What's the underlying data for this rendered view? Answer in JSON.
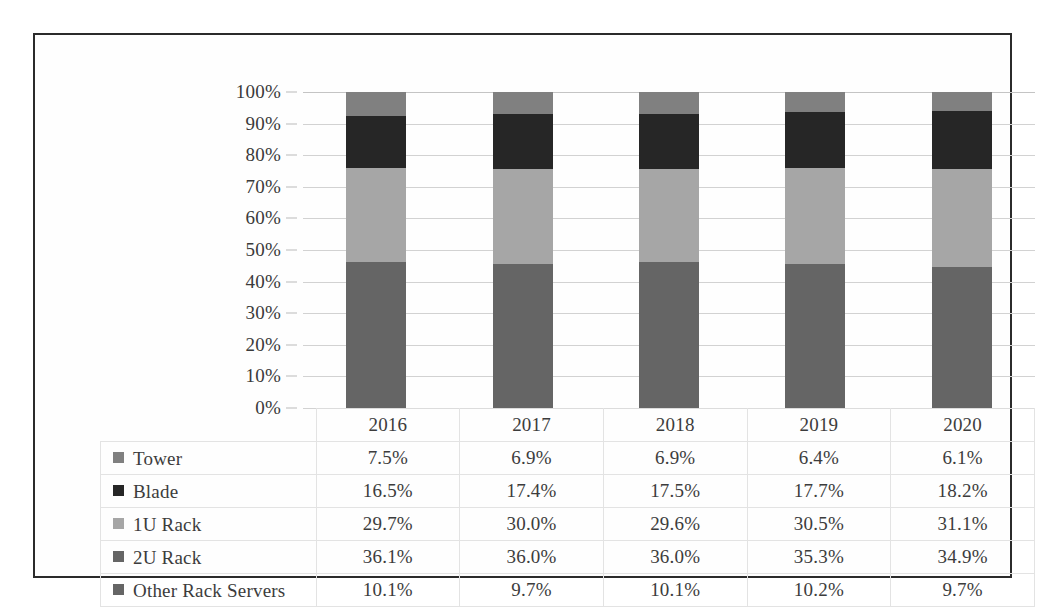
{
  "chart_data": {
    "type": "bar",
    "subtype": "100% stacked column with data table",
    "title": "",
    "xlabel": "",
    "ylabel": "",
    "ylim": [
      0,
      100
    ],
    "grid": true,
    "legend_position": "data-table-row-headers",
    "categories": [
      "2016",
      "2017",
      "2018",
      "2019",
      "2020"
    ],
    "y_ticks": [
      "0%",
      "10%",
      "20%",
      "30%",
      "40%",
      "50%",
      "60%",
      "70%",
      "80%",
      "90%",
      "100%"
    ],
    "y_tick_values": [
      0,
      10,
      20,
      30,
      40,
      50,
      60,
      70,
      80,
      90,
      100
    ],
    "stack_order_top_to_bottom": [
      "Tower",
      "Blade",
      "1U Rack",
      "2U Rack",
      "Other Rack Servers"
    ],
    "series": [
      {
        "name": "Tower",
        "color": "#808080",
        "values": [
          7.5,
          6.9,
          6.9,
          6.4,
          6.1
        ],
        "labels": [
          "7.5%",
          "6.9%",
          "6.9%",
          "6.4%",
          "6.1%"
        ]
      },
      {
        "name": "Blade",
        "color": "#262626",
        "values": [
          16.5,
          17.4,
          17.5,
          17.7,
          18.2
        ],
        "labels": [
          "16.5%",
          "17.4%",
          "17.5%",
          "17.7%",
          "18.2%"
        ]
      },
      {
        "name": "1U Rack",
        "color": "#a6a6a6",
        "values": [
          29.7,
          30.0,
          29.6,
          30.5,
          31.1
        ],
        "labels": [
          "29.7%",
          "30.0%",
          "29.6%",
          "30.5%",
          "31.1%"
        ]
      },
      {
        "name": "2U Rack",
        "color": "#656565",
        "values": [
          36.1,
          36.0,
          36.0,
          35.3,
          34.9
        ],
        "labels": [
          "36.1%",
          "36.0%",
          "36.0%",
          "35.3%",
          "34.9%"
        ]
      },
      {
        "name": "Other Rack Servers",
        "color": "#656565",
        "values": [
          10.1,
          9.7,
          10.1,
          10.2,
          9.7
        ],
        "labels": [
          "10.1%",
          "9.7%",
          "10.1%",
          "10.2%",
          "9.7%"
        ]
      }
    ]
  },
  "table": {
    "corner_label": "",
    "header": [
      "2016",
      "2017",
      "2018",
      "2019",
      "2020"
    ],
    "rows": [
      {
        "label": "Tower",
        "swatch": "#808080",
        "cells": [
          "7.5%",
          "6.9%",
          "6.9%",
          "6.4%",
          "6.1%"
        ]
      },
      {
        "label": "Blade",
        "swatch": "#262626",
        "cells": [
          "16.5%",
          "17.4%",
          "17.5%",
          "17.7%",
          "18.2%"
        ]
      },
      {
        "label": "1U Rack",
        "swatch": "#a6a6a6",
        "cells": [
          "29.7%",
          "30.0%",
          "29.6%",
          "30.5%",
          "31.1%"
        ]
      },
      {
        "label": "2U Rack",
        "swatch": "#656565",
        "cells": [
          "36.1%",
          "36.0%",
          "36.0%",
          "35.3%",
          "34.9%"
        ]
      },
      {
        "label": "Other Rack Servers",
        "swatch": "#656565",
        "cells": [
          "10.1%",
          "9.7%",
          "10.1%",
          "10.2%",
          "9.7%"
        ]
      }
    ]
  }
}
